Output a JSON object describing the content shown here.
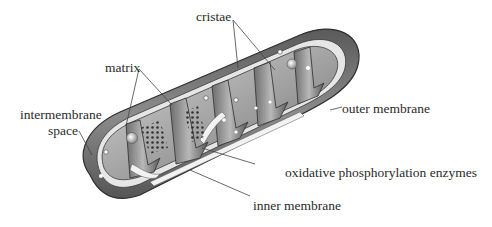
{
  "diagram": {
    "labels": {
      "cristae": "cristae",
      "matrix": "matrix",
      "intermembrane_space_line1": "intermembrane",
      "intermembrane_space_line2": "space",
      "outer_membrane": "outer membrane",
      "oxidative_phosphorylation_enzymes": "oxidative phosphorylation enzymes",
      "inner_membrane": "inner membrane"
    },
    "colors": {
      "outer_membrane_dark": "#4a4a4a",
      "outer_membrane_mid": "#8a8a8a",
      "intermembrane_light": "#e8e8e8",
      "matrix_gray": "#a8a8a8",
      "label_text": "#2a2a2a",
      "leader_line": "#444444"
    }
  }
}
